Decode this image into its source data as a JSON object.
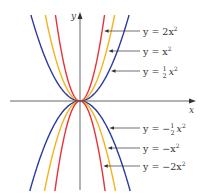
{
  "chart_data": {
    "type": "line",
    "title": "",
    "xlabel": "x",
    "ylabel": "y",
    "grid": false,
    "legend_position": "right (labels with leader arrows)",
    "xlim": [
      -5.7,
      8.3
    ],
    "ylim": [
      -6.4,
      6.5
    ],
    "series": [
      {
        "name": "y = 2x²",
        "a": 2,
        "color": "#e8323c"
      },
      {
        "name": "y = x²",
        "a": 1,
        "color": "#f5b21b"
      },
      {
        "name": "y = ½x²",
        "a": 0.5,
        "color": "#2b3a9c"
      },
      {
        "name": "y = −½x²",
        "a": -0.5,
        "color": "#2b3a9c"
      },
      {
        "name": "y = −x²",
        "a": -1,
        "color": "#f5b21b"
      },
      {
        "name": "y = −2x²",
        "a": -2,
        "color": "#e8323c"
      }
    ]
  },
  "labels": {
    "top": [
      {
        "pre": "y = 2x",
        "sup": "2",
        "frac": false
      },
      {
        "pre": "y = x",
        "sup": "2",
        "frac": false
      },
      {
        "pre": "y = ",
        "frac": true,
        "post": "x",
        "sup": "2"
      }
    ],
    "bottom": [
      {
        "pre": "y = −",
        "frac": true,
        "post": "x",
        "sup": "2"
      },
      {
        "pre": "y = −x",
        "sup": "2",
        "frac": false
      },
      {
        "pre": "y = −2x",
        "sup": "2",
        "frac": false
      }
    ],
    "frac_num": "1",
    "frac_den": "2"
  },
  "axes": {
    "x_label": "x",
    "y_label": "y"
  },
  "colors": {
    "axis": "#555555",
    "arrow": "#333333"
  }
}
